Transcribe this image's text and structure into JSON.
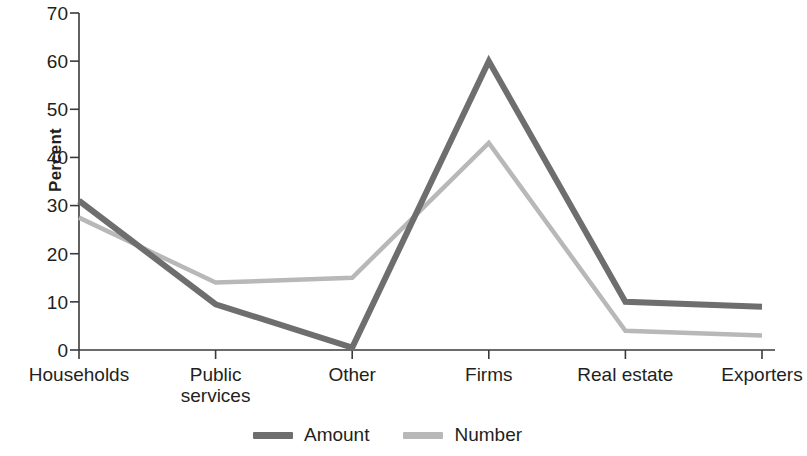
{
  "chart_data": {
    "type": "line",
    "title": "",
    "xlabel": "",
    "ylabel": "Percent",
    "ylim": [
      0,
      70
    ],
    "yticks": [
      0,
      10,
      20,
      30,
      40,
      50,
      60,
      70
    ],
    "grid": false,
    "legend_position": "bottom-center",
    "categories": [
      "Households",
      "Public\nservices",
      "Other",
      "Firms",
      "Real estate",
      "Exporters"
    ],
    "series": [
      {
        "name": "Amount",
        "color": "#6e6e6e",
        "values": [
          31,
          9.5,
          0.5,
          60,
          10,
          9
        ]
      },
      {
        "name": "Number",
        "color": "#b8b8b8",
        "values": [
          27.5,
          14,
          15,
          43,
          4,
          3
        ]
      }
    ]
  },
  "axis": {
    "y_label": "Percent",
    "y_tick_labels": [
      "70",
      "60",
      "50",
      "40",
      "30",
      "20",
      "10",
      "0"
    ],
    "x_tick_labels": [
      "Households",
      "Public\nservices",
      "Other",
      "Firms",
      "Real estate",
      "Exporters"
    ]
  },
  "legend": {
    "entries": [
      {
        "label": "Amount",
        "color": "#6e6e6e"
      },
      {
        "label": "Number",
        "color": "#b8b8b8"
      }
    ]
  }
}
